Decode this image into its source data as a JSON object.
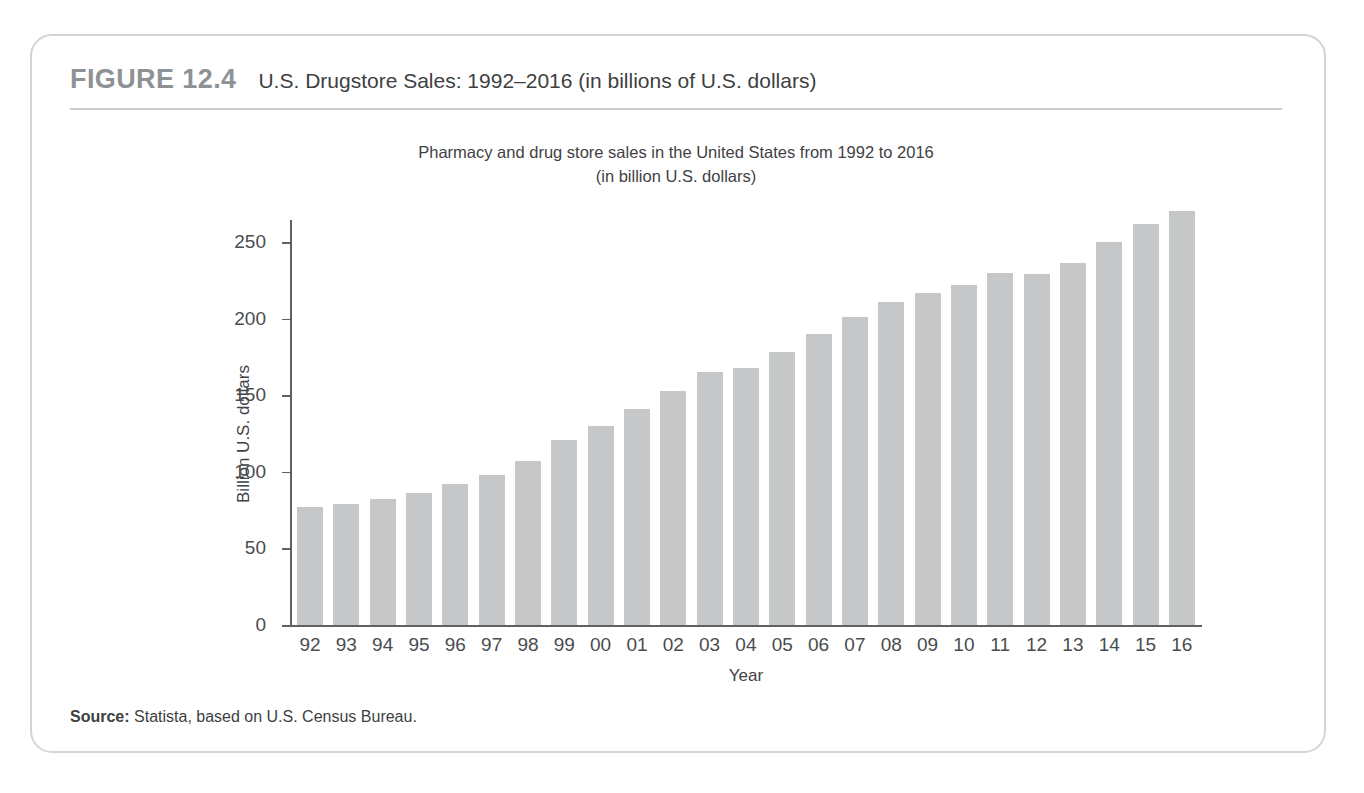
{
  "figure": {
    "number": "FIGURE 12.4",
    "title": "U.S. Drugstore Sales: 1992–2016 (in billions of U.S. dollars)",
    "source_label": "Source:",
    "source_text": " Statista, based on U.S. Census Bureau."
  },
  "chart_data": {
    "type": "bar",
    "title": "Pharmacy and drug store sales in the United States from 1992 to 2016",
    "subtitle": "(in billion U.S. dollars)",
    "xlabel": "Year",
    "ylabel": "Billion U.S. dollars",
    "ylim": [
      0,
      250
    ],
    "yticks": [
      0,
      50,
      100,
      150,
      200,
      250
    ],
    "ytick_labels": [
      "0",
      "50",
      "100",
      "150",
      "200",
      "250"
    ],
    "grid": false,
    "legend": false,
    "bar_color": "#c6c7c9",
    "categories": [
      "92",
      "93",
      "94",
      "95",
      "96",
      "97",
      "98",
      "99",
      "00",
      "01",
      "02",
      "03",
      "04",
      "05",
      "06",
      "07",
      "08",
      "09",
      "10",
      "11",
      "12",
      "13",
      "14",
      "15",
      "16"
    ],
    "full_years": [
      1992,
      1993,
      1994,
      1995,
      1996,
      1997,
      1998,
      1999,
      2000,
      2001,
      2002,
      2003,
      2004,
      2005,
      2006,
      2007,
      2008,
      2009,
      2010,
      2011,
      2012,
      2013,
      2014,
      2015,
      2016
    ],
    "values": [
      77,
      79,
      82,
      86,
      92,
      98,
      107,
      121,
      130,
      141,
      153,
      165,
      168,
      178,
      190,
      201,
      211,
      217,
      222,
      230,
      229,
      236,
      250,
      262,
      270
    ]
  }
}
